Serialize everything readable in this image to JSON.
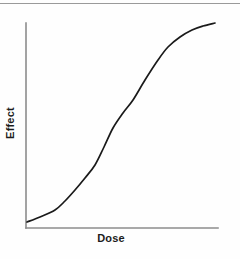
{
  "chart_data": {
    "type": "line",
    "title": "",
    "subtitle": "",
    "xlabel": "Dose",
    "ylabel": "Effect",
    "grid": false,
    "legend": null,
    "legend_position": "none",
    "annotations": [],
    "xticklabels": [],
    "yticklabels": [],
    "xlim": [
      0,
      10
    ],
    "ylim": [
      0,
      1
    ],
    "axis_color": "#8c8c8c",
    "curve_color": "#1a1a1a",
    "background_color": "#fefefe",
    "series": [
      {
        "name": "dose-response",
        "x": [
          0.0,
          0.5,
          1.0,
          1.5,
          2.0,
          2.5,
          3.0,
          3.5,
          4.0,
          4.5,
          5.0,
          5.5,
          6.0,
          6.5,
          7.0,
          7.5,
          8.0,
          8.5,
          9.0,
          9.5,
          10.0
        ],
        "y": [
          0.03,
          0.04,
          0.06,
          0.08,
          0.11,
          0.16,
          0.22,
          0.31,
          0.41,
          0.51,
          0.61,
          0.7,
          0.78,
          0.85,
          0.9,
          0.93,
          0.95,
          0.97,
          0.98,
          0.99,
          1.0
        ]
      }
    ],
    "path_points_px": [
      [
        27,
        222
      ],
      [
        40,
        217
      ],
      [
        55,
        210
      ],
      [
        65,
        201
      ],
      [
        75,
        190
      ],
      [
        85,
        178
      ],
      [
        95,
        165
      ],
      [
        104,
        147
      ],
      [
        113,
        128
      ],
      [
        123,
        113
      ],
      [
        133,
        100
      ],
      [
        145,
        80
      ],
      [
        158,
        60
      ],
      [
        168,
        47
      ],
      [
        180,
        37
      ],
      [
        192,
        30
      ],
      [
        203,
        26
      ],
      [
        215,
        23
      ]
    ],
    "axes_px": {
      "x_axis": {
        "x1": 26,
        "y1": 228,
        "x2": 218,
        "y2": 228
      },
      "y_axis": {
        "x1": 26,
        "y1": 23,
        "x2": 26,
        "y2": 228
      }
    }
  },
  "labels": {
    "y_axis": "Effect",
    "x_axis": "Dose"
  }
}
